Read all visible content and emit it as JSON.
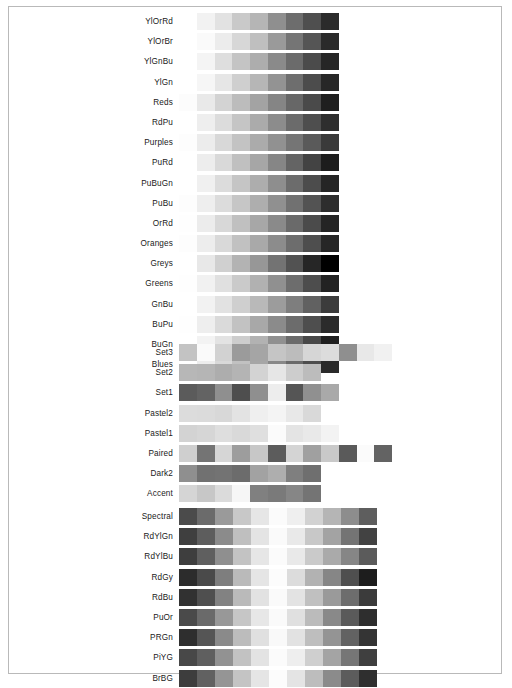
{
  "figure": {
    "background_color": "#ffffff",
    "frame_color": "#b9b9b9",
    "label_color": "#1a1a1a",
    "rendering": "grayscale"
  },
  "chart_data": {
    "type": "heatmap",
    "xlabel": "",
    "ylabel": "",
    "grid": false,
    "legend_position": "none",
    "sections": [
      {
        "name": "Sequential",
        "bar_left_px": 170,
        "bar_width_px": 160,
        "rows": [
          {
            "label": "YlOrRd",
            "n": 9,
            "values": [
              "#ffffff",
              "#f2f2f2",
              "#e2e2e2",
              "#c9c9c9",
              "#b5b5b5",
              "#8f8f8f",
              "#6d6d6d",
              "#4f4f4f",
              "#2b2b2b"
            ]
          },
          {
            "label": "YlOrBr",
            "n": 9,
            "values": [
              "#ffffff",
              "#fafafa",
              "#ececec",
              "#d7d7d7",
              "#bfbfbf",
              "#9a9a9a",
              "#757575",
              "#555555",
              "#2a2a2a"
            ]
          },
          {
            "label": "YlGnBu",
            "n": 9,
            "values": [
              "#ffffff",
              "#f4f4f4",
              "#dedede",
              "#c4c4c4",
              "#adadad",
              "#8a8a8a",
              "#6b6b6b",
              "#4b4b4b",
              "#262626"
            ]
          },
          {
            "label": "YlGn",
            "n": 9,
            "values": [
              "#ffffff",
              "#f6f6f6",
              "#e6e6e6",
              "#cfcfcf",
              "#b6b6b6",
              "#939393",
              "#6e6e6e",
              "#4c4c4c",
              "#272727"
            ]
          },
          {
            "label": "Reds",
            "n": 9,
            "values": [
              "#fcfcfc",
              "#e9e9e9",
              "#d3d3d3",
              "#bcbcbc",
              "#a3a3a3",
              "#858585",
              "#676767",
              "#4a4a4a",
              "#1f1f1f"
            ]
          },
          {
            "label": "RdPu",
            "n": 9,
            "values": [
              "#ffffff",
              "#eeeeee",
              "#dcdcdc",
              "#c5c5c5",
              "#ababab",
              "#8c8c8c",
              "#6b6b6b",
              "#4e4e4e",
              "#2e2e2e"
            ]
          },
          {
            "label": "Purples",
            "n": 9,
            "values": [
              "#fdfdfd",
              "#ececec",
              "#d8d8d8",
              "#c3c3c3",
              "#ababab",
              "#919191",
              "#757575",
              "#5a5a5a",
              "#3a3a3a"
            ]
          },
          {
            "label": "PuRd",
            "n": 9,
            "values": [
              "#ffffff",
              "#ededed",
              "#d9d9d9",
              "#c0c0c0",
              "#a6a6a6",
              "#868686",
              "#646464",
              "#434343",
              "#1d1d1d"
            ]
          },
          {
            "label": "PuBuGn",
            "n": 9,
            "values": [
              "#ffffff",
              "#f0f0f0",
              "#dcdcdc",
              "#c5c5c5",
              "#adadad",
              "#8e8e8e",
              "#6c6c6c",
              "#4c4c4c",
              "#252525"
            ]
          },
          {
            "label": "PuBu",
            "n": 9,
            "values": [
              "#fdfdfd",
              "#eeeeee",
              "#dcdcdc",
              "#c6c6c6",
              "#aeaeae",
              "#909090",
              "#717171",
              "#535353",
              "#2d2d2d"
            ]
          },
          {
            "label": "OrRd",
            "n": 9,
            "values": [
              "#fefefe",
              "#ececec",
              "#d8d8d8",
              "#c0c0c0",
              "#a7a7a7",
              "#8a8a8a",
              "#6a6a6a",
              "#4b4b4b",
              "#242424"
            ]
          },
          {
            "label": "Oranges",
            "n": 9,
            "values": [
              "#fdfdfd",
              "#ededed",
              "#d9d9d9",
              "#c1c1c1",
              "#a9a9a9",
              "#8c8c8c",
              "#6d6d6d",
              "#4e4e4e",
              "#262626"
            ]
          },
          {
            "label": "Greys",
            "n": 9,
            "values": [
              "#ffffff",
              "#e8e8e8",
              "#d0d0d0",
              "#b3b3b3",
              "#979797",
              "#737373",
              "#525252",
              "#262626",
              "#000000"
            ]
          },
          {
            "label": "Greens",
            "n": 9,
            "values": [
              "#fefefe",
              "#f1f1f1",
              "#e0e0e0",
              "#cacaca",
              "#b1b1b1",
              "#909090",
              "#6d6d6d",
              "#4d4d4d",
              "#222222"
            ]
          },
          {
            "label": "GnBu",
            "n": 9,
            "values": [
              "#ffffff",
              "#f2f2f2",
              "#e2e2e2",
              "#cfcfcf",
              "#b9b9b9",
              "#9c9c9c",
              "#7e7e7e",
              "#616161",
              "#3c3c3c"
            ]
          },
          {
            "label": "BuPu",
            "n": 9,
            "values": [
              "#fefefe",
              "#eeeeee",
              "#dadada",
              "#c2c2c2",
              "#a8a8a8",
              "#8b8b8b",
              "#6c6c6c",
              "#4e4e4e",
              "#2b2b2b"
            ]
          },
          {
            "label": "BuGn",
            "n": 9,
            "values": [
              "#ffffff",
              "#f3f3f3",
              "#e3e3e3",
              "#cdcdcd",
              "#b2b2b2",
              "#909090",
              "#6b6b6b",
              "#484848",
              "#1f1f1f"
            ]
          },
          {
            "label": "Blues",
            "n": 9,
            "values": [
              "#ffffff",
              "#ededed",
              "#d9d9d9",
              "#c1c1c1",
              "#a6a6a6",
              "#888888",
              "#6a6a6a",
              "#4d4d4d",
              "#2a2a2a"
            ]
          }
        ]
      },
      {
        "name": "Qualitative",
        "bar_left_px": 170,
        "rows": [
          {
            "label": "Set3",
            "n": 12,
            "bar_width_px": 213,
            "values": [
              "#c3c3c3",
              "#fafafa",
              "#d2d2d2",
              "#9b9b9b",
              "#a5a5a5",
              "#c5c5c5",
              "#bcbcbc",
              "#d6d6d6",
              "#dcdcdc",
              "#8f8f8f",
              "#e8e8e8",
              "#f1f1f1"
            ]
          },
          {
            "label": "Set2",
            "n": 8,
            "bar_width_px": 142,
            "values": [
              "#b7b7b7",
              "#b5b5b5",
              "#adadad",
              "#b4b4b4",
              "#d3d3d3",
              "#e6e6e6",
              "#cdcdcd",
              "#bcbcbc"
            ]
          },
          {
            "label": "Set1",
            "n": 9,
            "bar_width_px": 160,
            "values": [
              "#5b5b5b",
              "#636363",
              "#8f8f8f",
              "#4e4e4e",
              "#8f8f8f",
              "#ededed",
              "#555555",
              "#909090",
              "#a9a9a9"
            ]
          },
          {
            "label": "Pastel2",
            "n": 8,
            "bar_width_px": 142,
            "values": [
              "#dcdcdc",
              "#dbdbdb",
              "#d8d8d8",
              "#e3e3e3",
              "#efefef",
              "#f4f4f4",
              "#e8e8e8",
              "#d9d9d9"
            ]
          },
          {
            "label": "Pastel1",
            "n": 9,
            "bar_width_px": 160,
            "values": [
              "#d3d3d3",
              "#d6d6d6",
              "#dedede",
              "#d9d9d9",
              "#dfdfdf",
              "#fbfbfb",
              "#e4e4e4",
              "#e9e9e9",
              "#f3f3f3"
            ]
          },
          {
            "label": "Paired",
            "n": 12,
            "bar_width_px": 213,
            "values": [
              "#cfcfcf",
              "#747474",
              "#d6d6d6",
              "#9d9d9d",
              "#c7c7c7",
              "#5c5c5c",
              "#d4d4d4",
              "#a0a0a0",
              "#c9c9c9",
              "#5a5a5a",
              "#fbfbfb",
              "#636363"
            ]
          },
          {
            "label": "Dark2",
            "n": 8,
            "bar_width_px": 142,
            "values": [
              "#8f8f8f",
              "#717171",
              "#737373",
              "#6c6c6c",
              "#a2a2a2",
              "#aeaeae",
              "#7f7f7f",
              "#6f6f6f"
            ]
          },
          {
            "label": "Accent",
            "n": 8,
            "bar_width_px": 142,
            "values": [
              "#d5d5d5",
              "#c7c7c7",
              "#dbdbdb",
              "#f6f6f6",
              "#808080",
              "#7a7a7a",
              "#868686",
              "#747474"
            ]
          }
        ]
      },
      {
        "name": "Diverging",
        "bar_left_px": 170,
        "bar_width_px": 198,
        "rows": [
          {
            "label": "Spectral",
            "n": 11,
            "values": [
              "#4b4b4b",
              "#6b6b6b",
              "#9a9a9a",
              "#c8c8c8",
              "#e6e6e6",
              "#fbfbfb",
              "#efefef",
              "#d2d2d2",
              "#b5b5b5",
              "#8d8d8d",
              "#5e5e5e"
            ]
          },
          {
            "label": "RdYlGn",
            "n": 11,
            "values": [
              "#3f3f3f",
              "#5d5d5d",
              "#8b8b8b",
              "#bfbfbf",
              "#e4e4e4",
              "#fafafa",
              "#e9e9e9",
              "#c8c8c8",
              "#a3a3a3",
              "#747474",
              "#424242"
            ]
          },
          {
            "label": "RdYlBu",
            "n": 11,
            "values": [
              "#3e3e3e",
              "#5f5f5f",
              "#8f8f8f",
              "#c3c3c3",
              "#e6e6e6",
              "#fbfbfb",
              "#e9e9e9",
              "#cacaca",
              "#aaaaaa",
              "#868686",
              "#5b5b5b"
            ]
          },
          {
            "label": "RdGy",
            "n": 11,
            "values": [
              "#2c2c2c",
              "#4a4a4a",
              "#7e7e7e",
              "#bababa",
              "#e5e5e5",
              "#fcfcfc",
              "#dcdcdc",
              "#b2b2b2",
              "#868686",
              "#4f4f4f",
              "#1d1d1d"
            ]
          },
          {
            "label": "RdBu",
            "n": 11,
            "values": [
              "#313131",
              "#4f4f4f",
              "#828282",
              "#bababa",
              "#e2e2e2",
              "#fafafa",
              "#e3e3e3",
              "#c0c0c0",
              "#9a9a9a",
              "#6d6d6d",
              "#3b3b3b"
            ]
          },
          {
            "label": "PuOr",
            "n": 11,
            "values": [
              "#4a4a4a",
              "#6a6a6a",
              "#989898",
              "#c6c6c6",
              "#e7e7e7",
              "#fafafa",
              "#e0e0e0",
              "#bbbbbb",
              "#898989",
              "#5a5a5a",
              "#2e2e2e"
            ]
          },
          {
            "label": "PRGn",
            "n": 11,
            "values": [
              "#2e2e2e",
              "#555555",
              "#8a8a8a",
              "#bcbcbc",
              "#e0e0e0",
              "#f9f9f9",
              "#e2e2e2",
              "#bebebe",
              "#949494",
              "#626262",
              "#343434"
            ]
          },
          {
            "label": "PiYG",
            "n": 11,
            "values": [
              "#484848",
              "#5f5f5f",
              "#929292",
              "#c2c2c2",
              "#e3e3e3",
              "#fbfbfb",
              "#eeeeee",
              "#cfcfcf",
              "#a4a4a4",
              "#767676",
              "#3f3f3f"
            ]
          },
          {
            "label": "BrBG",
            "n": 11,
            "values": [
              "#3d3d3d",
              "#616161",
              "#959595",
              "#c4c4c4",
              "#e5e5e5",
              "#fcfcfc",
              "#e4e4e4",
              "#bdbdbd",
              "#8b8b8b",
              "#5c5c5c",
              "#2f2f2f"
            ]
          }
        ]
      }
    ]
  },
  "caption": {
    "text": ""
  }
}
